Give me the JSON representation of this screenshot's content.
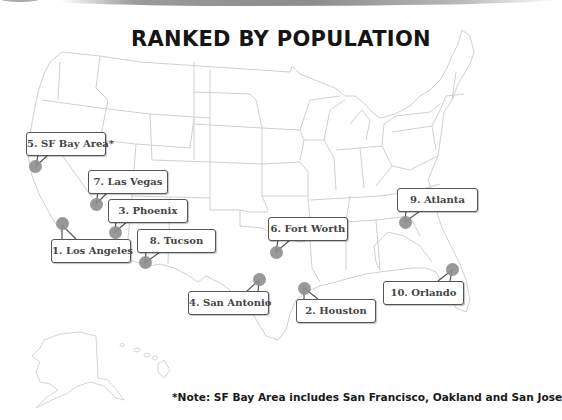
{
  "title": "RANKED BY POPULATION",
  "note": "*Note: SF Bay Area includes San Francisco, Oakland and San Jose",
  "colors": {
    "title": "#151515",
    "dot": "#8e8e8e",
    "callout_border": "#555555",
    "map_lines": "#c8c8c8"
  },
  "cities": [
    {
      "rank": 1,
      "label": "1. Los Angeles"
    },
    {
      "rank": 2,
      "label": "2. Houston"
    },
    {
      "rank": 3,
      "label": "3. Phoenix"
    },
    {
      "rank": 4,
      "label": "4. San Antonio"
    },
    {
      "rank": 5,
      "label": "5. SF Bay Area*"
    },
    {
      "rank": 6,
      "label": "6. Fort Worth"
    },
    {
      "rank": 7,
      "label": "7. Las Vegas"
    },
    {
      "rank": 8,
      "label": "8. Tucson"
    },
    {
      "rank": 9,
      "label": "9. Atlanta"
    },
    {
      "rank": 10,
      "label": "10. Orlando"
    }
  ]
}
